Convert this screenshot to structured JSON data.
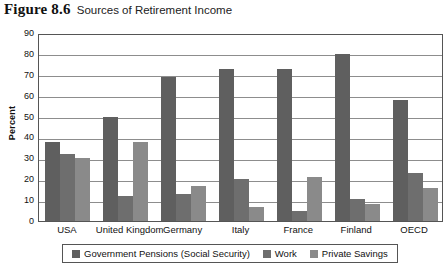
{
  "figure": {
    "label": "Figure 8.6",
    "title": "Sources of Retirement Income"
  },
  "chart_data": {
    "type": "bar",
    "title": "Sources of Retirement Income",
    "xlabel": "",
    "ylabel": "Percent",
    "ylim": [
      0,
      90
    ],
    "yticks": [
      0,
      10,
      20,
      30,
      40,
      50,
      60,
      70,
      80,
      90
    ],
    "grid": true,
    "legend_position": "bottom",
    "categories": [
      "USA",
      "United Kingdom",
      "Germany",
      "Italy",
      "France",
      "Finland",
      "OECD"
    ],
    "series": [
      {
        "name": "Government Pensions (Social Security)",
        "color": "#5f5f5f",
        "values": [
          38,
          50,
          69,
          73,
          73,
          80,
          58
        ]
      },
      {
        "name": "Work",
        "color": "#6e6e6e",
        "values": [
          32,
          12,
          13,
          20,
          5,
          10.5,
          23
        ]
      },
      {
        "name": "Private Savings",
        "color": "#8a8a8a",
        "values": [
          30,
          38,
          17,
          6.5,
          21,
          8,
          16
        ]
      }
    ]
  }
}
